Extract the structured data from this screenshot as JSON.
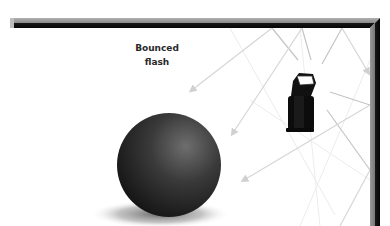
{
  "diagram": {
    "title": "Bounced flash",
    "label_lines": [
      "Bounced",
      "flash"
    ],
    "elements": {
      "ceiling": "ceiling-wall",
      "right_wall": "side-wall",
      "flash_unit": "speedlight-flash",
      "subject": "sphere",
      "rays": "light-rays"
    },
    "colors": {
      "background": "#ffffff",
      "wall_light": "#9a9a9a",
      "wall_dark": "#111111",
      "ray": "#c8c8c8",
      "ray_faint": "#e6e6e6",
      "sphere_dark": "#1e1e1e",
      "sphere_light": "#6a6a6a",
      "flash_body": "#0c0c0c",
      "label": "#2a2a2a"
    }
  }
}
